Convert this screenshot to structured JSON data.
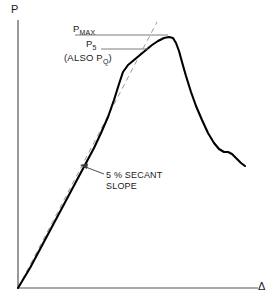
{
  "figure": {
    "title": "",
    "background_color": "#ffffff",
    "curve_color": "#000000",
    "axis_color": "#555555",
    "secant_color": "#999999",
    "leader_color": "#777777"
  },
  "axes": {
    "y_label": "P",
    "x_label": "Δ",
    "y_axis_x": 18,
    "y_axis_top": 20,
    "y_axis_bottom": 288,
    "x_axis_y": 288,
    "x_axis_left": 18,
    "x_axis_right": 258
  },
  "annotations": {
    "pmax": {
      "text": "P",
      "sub": "MAX",
      "leader_x1": 75,
      "leader_x2": 168,
      "leader_y": 35
    },
    "p5": {
      "text": "P",
      "sub": "5",
      "leader_x1": 101,
      "leader_x2": 148,
      "leader_y": 49
    },
    "pq": {
      "text": "(ALSO P",
      "sub": "Q",
      "text_end": ")"
    },
    "secant": {
      "line1": "5 % SECANT",
      "line2": "SLOPE",
      "arrow_from_x": 104,
      "arrow_from_y": 174,
      "arrow_to_x": 82,
      "arrow_to_y": 166
    }
  },
  "chart_data": {
    "type": "line",
    "title": "",
    "xlabel": "Δ",
    "ylabel": "P",
    "xlim": [
      0,
      274
    ],
    "ylim": [
      0,
      302
    ],
    "grid": false,
    "legend": "none",
    "series": [
      {
        "name": "load-displacement-curve",
        "style": "solid",
        "color": "#000000",
        "points": [
          [
            18,
            288
          ],
          [
            24,
            278
          ],
          [
            30,
            268
          ],
          [
            38,
            253
          ],
          [
            46,
            238
          ],
          [
            54,
            223
          ],
          [
            62,
            208
          ],
          [
            70,
            193
          ],
          [
            78,
            178
          ],
          [
            86,
            163
          ],
          [
            94,
            148
          ],
          [
            101,
            133
          ],
          [
            108,
            117
          ],
          [
            114,
            100
          ],
          [
            119,
            84
          ],
          [
            123,
            72
          ],
          [
            128,
            65
          ],
          [
            134,
            60
          ],
          [
            140,
            55
          ],
          [
            146,
            50
          ],
          [
            152,
            45
          ],
          [
            158,
            41
          ],
          [
            164,
            38
          ],
          [
            169,
            37
          ],
          [
            173,
            38
          ],
          [
            176,
            43
          ],
          [
            179,
            51
          ],
          [
            182,
            62
          ],
          [
            186,
            76
          ],
          [
            191,
            92
          ],
          [
            196,
            106
          ],
          [
            202,
            120
          ],
          [
            208,
            133
          ],
          [
            214,
            143
          ],
          [
            219,
            149
          ],
          [
            224,
            152
          ],
          [
            228,
            152
          ],
          [
            232,
            154
          ],
          [
            236,
            158
          ],
          [
            241,
            163
          ],
          [
            245,
            166
          ]
        ]
      },
      {
        "name": "five-percent-secant-line",
        "style": "dashed",
        "color": "#999999",
        "points": [
          [
            18,
            288
          ],
          [
            157,
            22
          ]
        ]
      }
    ],
    "markers": [
      {
        "name": "P_MAX",
        "label": "P_MAX",
        "x": 169,
        "y": 37
      },
      {
        "name": "P_5",
        "label": "P_5 (also P_Q)",
        "x": 148,
        "y": 49
      }
    ]
  }
}
